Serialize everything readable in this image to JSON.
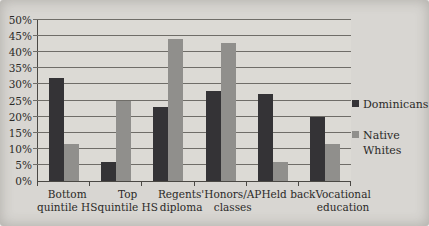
{
  "chart_data": {
    "type": "bar",
    "title": "",
    "categories": [
      "Bottom quintile HS",
      "Top quintile HS",
      "Regents' diploma",
      "Honors/AP classes",
      "Held back",
      "Vocational education"
    ],
    "categories_lines": [
      [
        "Bottom",
        "quintile HS"
      ],
      [
        "Top",
        "quintile HS"
      ],
      [
        "Regents'",
        "diploma"
      ],
      [
        "Honors/AP",
        "classes"
      ],
      [
        "Held back"
      ],
      [
        "Vocational",
        "education"
      ]
    ],
    "series": [
      {
        "name": "Dominicans",
        "color": "#343336",
        "values": [
          32,
          6,
          23,
          28,
          27,
          20
        ]
      },
      {
        "name": "Native Whites",
        "color": "#908f8c",
        "values": [
          11.5,
          25,
          44,
          43,
          6,
          11.5
        ]
      }
    ],
    "ylim": [
      0,
      50
    ],
    "yticks": [
      "0%",
      "5%",
      "10%",
      "15%",
      "20%",
      "25%",
      "30%",
      "35%",
      "40%",
      "45%",
      "50%"
    ],
    "grid": true,
    "legend_position": "right"
  },
  "colors": {
    "background": "#d8d6d2",
    "plot_background": "#dcdad5",
    "gridline": "#6f6d68",
    "axis": "#4a4844",
    "text": "#2b2a28"
  }
}
